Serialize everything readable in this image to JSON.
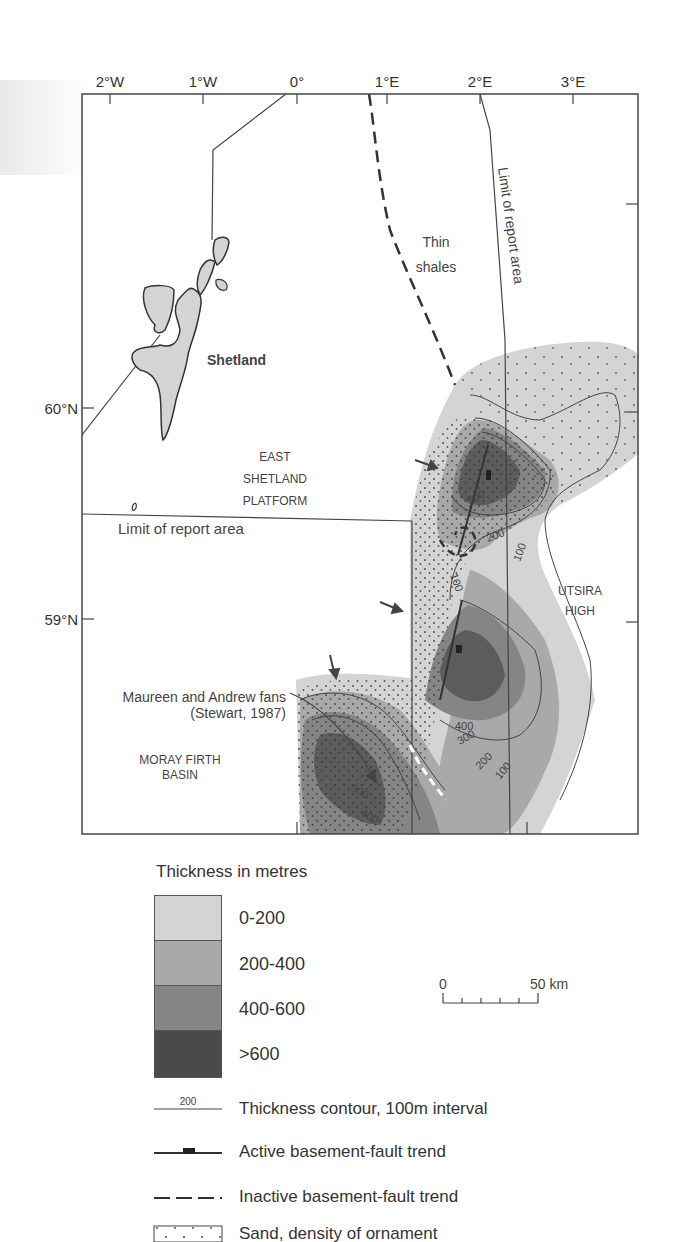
{
  "map": {
    "longitude_ticks": [
      {
        "label": "2°W",
        "x": 110
      },
      {
        "label": "1°W",
        "x": 203
      },
      {
        "label": "0°",
        "x": 297
      },
      {
        "label": "1°E",
        "x": 387
      },
      {
        "label": "2°E",
        "x": 480
      },
      {
        "label": "3°E",
        "x": 573
      }
    ],
    "latitude_ticks": [
      {
        "label": "60°N",
        "y": 408
      },
      {
        "label": "59°N",
        "y": 619
      }
    ],
    "labels": {
      "shetland": "Shetland",
      "thin_shales_1": "Thin",
      "thin_shales_2": "shales",
      "limit_report_area_vertical": "Limit of report area",
      "east_shetland_1": "EAST",
      "east_shetland_2": "SHETLAND",
      "east_shetland_3": "PLATFORM",
      "limit_report_area_horizontal": "Limit of report area",
      "utsira_1": "UTSIRA",
      "utsira_2": "HIGH",
      "maureen_1": "Maureen and Andrew fans",
      "maureen_2": "(Stewart, 1987)",
      "moray_1": "MORAY FIRTH",
      "moray_2": "BASIN"
    },
    "contour_labels": [
      "500",
      "200",
      "100",
      "100",
      "400",
      "300",
      "200",
      "100",
      "500",
      "400"
    ]
  },
  "legend": {
    "title": "Thickness in metres",
    "classes": [
      {
        "label": "0-200",
        "color": "#d4d4d4"
      },
      {
        "label": "200-400",
        "color": "#a9a9a9"
      },
      {
        "label": "400-600",
        "color": "#858585"
      },
      {
        "label": ">600",
        "color": "#4a4a4a"
      }
    ],
    "scale": {
      "start": "0",
      "end": "50 km"
    },
    "symbols": [
      {
        "sample": "200",
        "label": "Thickness contour, 100m interval"
      },
      {
        "label": "Active basement-fault trend"
      },
      {
        "label": "Inactive basement-fault trend"
      },
      {
        "label": "Sand, density of ornament"
      }
    ]
  }
}
